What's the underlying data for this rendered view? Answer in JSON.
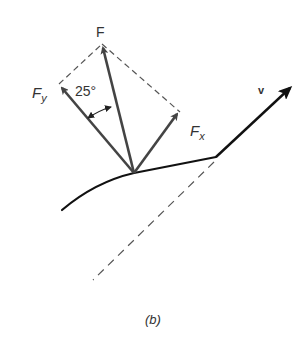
{
  "figure": {
    "caption": "(b)",
    "labels": {
      "force": "F",
      "force_y": "F",
      "force_y_sub": "y",
      "force_x": "F",
      "force_x_sub": "x",
      "angle": "25°",
      "velocity": "v"
    },
    "colors": {
      "force_arrows": "#444444",
      "curve": "#111111",
      "dashed": "#555555",
      "velocity_arrow": "#111111"
    }
  }
}
